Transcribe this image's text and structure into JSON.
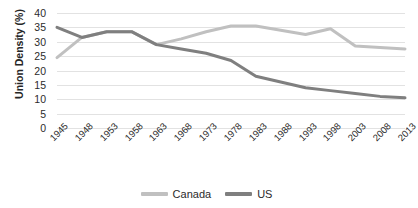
{
  "chart_data": {
    "type": "line",
    "title": "",
    "xlabel": "",
    "ylabel": "Union Density (%)",
    "ylim": [
      0,
      40
    ],
    "ytick_step": 5,
    "yticks": [
      40,
      35,
      30,
      25,
      20,
      15,
      10,
      5,
      0
    ],
    "grid": true,
    "legend_position": "bottom",
    "categories": [
      "1945",
      "1948",
      "1953",
      "1958",
      "1963",
      "1968",
      "1973",
      "1978",
      "1983",
      "1988",
      "1993",
      "1998",
      "2003",
      "2008",
      "2013"
    ],
    "series": [
      {
        "name": "Canada",
        "color": "#c0c0c0",
        "values": [
          24.5,
          31.5,
          33.5,
          33.5,
          29.0,
          31.0,
          33.5,
          35.5,
          35.5,
          34.0,
          32.5,
          34.5,
          28.5,
          28.0,
          27.5
        ]
      },
      {
        "name": "US",
        "color": "#7f7f7f",
        "values": [
          35.0,
          31.5,
          33.5,
          33.5,
          29.0,
          27.5,
          26.0,
          23.5,
          18.0,
          16.0,
          14.0,
          13.0,
          12.0,
          11.0,
          10.5
        ]
      }
    ]
  },
  "colors": {
    "gridline": "#e2e2e2",
    "text": "#2b2b2b",
    "background": "#ffffff"
  }
}
